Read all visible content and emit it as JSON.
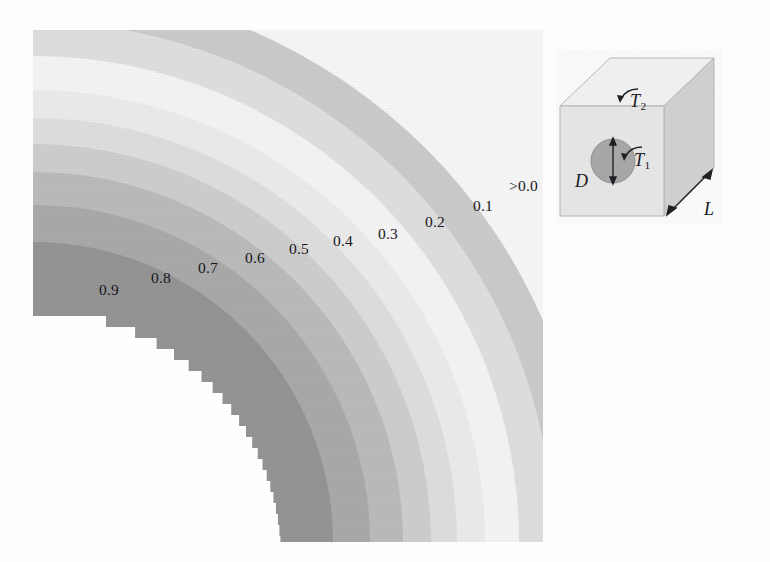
{
  "figure": {
    "background_color": "#fdfdfd"
  },
  "chart_data": {
    "type": "contour",
    "title": "",
    "subtitle": "",
    "xlabel": "",
    "ylabel": "",
    "grid": false,
    "legend_position": "inline-labels",
    "center": {
      "x": 0,
      "y": 512
    },
    "levels": [
      {
        "label": "0.9",
        "value": 0.9,
        "color": "#939393",
        "r_inner": 248,
        "r_outer": 300,
        "label_x": 66,
        "label_y": 252
      },
      {
        "label": "0.8",
        "value": 0.8,
        "color": "#a8a8a8",
        "r_inner": 300,
        "r_outer": 337,
        "label_x": 118,
        "label_y": 240
      },
      {
        "label": "0.7",
        "value": 0.7,
        "color": "#b9b9b9",
        "r_inner": 337,
        "r_outer": 370,
        "label_x": 165,
        "label_y": 230
      },
      {
        "label": "0.6",
        "value": 0.6,
        "color": "#cccccc",
        "r_inner": 370,
        "r_outer": 398,
        "label_x": 212,
        "label_y": 220
      },
      {
        "label": "0.5",
        "value": 0.5,
        "color": "#dcdcdc",
        "r_inner": 398,
        "r_outer": 424,
        "label_x": 256,
        "label_y": 211
      },
      {
        "label": "0.4",
        "value": 0.4,
        "color": "#e9e9e9",
        "r_inner": 424,
        "r_outer": 452,
        "label_x": 300,
        "label_y": 203
      },
      {
        "label": "0.3",
        "value": 0.3,
        "color": "#f2f2f2",
        "r_inner": 452,
        "r_outer": 486,
        "label_x": 345,
        "label_y": 196
      },
      {
        "label": "0.2",
        "value": 0.2,
        "color": "#dddddd",
        "r_inner": 486,
        "r_outer": 520,
        "label_x": 392,
        "label_y": 184
      },
      {
        "label": "0.1",
        "value": 0.1,
        "color": "#c9c9c9",
        "r_inner": 520,
        "r_outer": 556,
        "label_x": 440,
        "label_y": 168
      },
      {
        "label": ">0.0",
        "value": 0.0,
        "color": "#f4f4f4",
        "r_inner": 556,
        "r_outer": 760,
        "label_x": 483,
        "label_y": 148
      }
    ],
    "inner_region_color": "#ffffff",
    "inner_region_note": "white (>0.9) core with jagged pixelated boundary"
  },
  "contour_labels": [
    "0.9",
    "0.8",
    "0.7",
    "0.6",
    "0.5",
    "0.4",
    "0.3",
    "0.2",
    "0.1",
    ">0.0"
  ],
  "schematic": {
    "name": "rectangular-solid-with-circular-hole",
    "labels": {
      "T2": "T",
      "T2_sub": "2",
      "T1": "T",
      "T1_sub": "1",
      "D": "D",
      "L": "L"
    },
    "colors": {
      "top_face": "#efefef",
      "front_face": "#e4e4e4",
      "side_face": "#cfcfcf",
      "hole": "#a6a6a6",
      "outline": "#9a9a9a",
      "arrow": "#1f1f24"
    }
  }
}
